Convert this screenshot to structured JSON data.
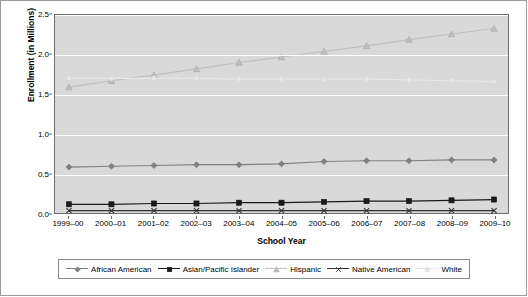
{
  "chart_data": {
    "type": "line",
    "title": "",
    "xlabel": "School Year",
    "ylabel": "Enrollment (in Millions)",
    "categories": [
      "1999–00",
      "2000–01",
      "2001–02",
      "2002–03",
      "2003–04",
      "2004–05",
      "2005–06",
      "2006–07",
      "2007–08",
      "2008–09",
      "2009–10"
    ],
    "ylim": [
      0.0,
      2.5
    ],
    "yticks": [
      0.0,
      0.5,
      1.0,
      1.5,
      2.0,
      2.5
    ],
    "ytick_labels": [
      "0.0",
      "0.5",
      "1.0",
      "1.5",
      "2.0",
      "2.5"
    ],
    "grid": "horizontal",
    "legend_position": "bottom",
    "series": [
      {
        "name": "African American",
        "color": "#808080",
        "marker": "diamond",
        "values": [
          0.58,
          0.59,
          0.6,
          0.61,
          0.61,
          0.62,
          0.65,
          0.66,
          0.66,
          0.67,
          0.67
        ]
      },
      {
        "name": "Asian/Pacific Islander",
        "color": "#1a1a1a",
        "marker": "square",
        "values": [
          0.11,
          0.11,
          0.12,
          0.12,
          0.13,
          0.13,
          0.14,
          0.15,
          0.15,
          0.16,
          0.17
        ]
      },
      {
        "name": "Hispanic",
        "color": "#bfbfbf",
        "marker": "triangle",
        "values": [
          1.59,
          1.67,
          1.74,
          1.82,
          1.9,
          1.97,
          2.04,
          2.11,
          2.19,
          2.26,
          2.33
        ]
      },
      {
        "name": "Native American",
        "color": "#333333",
        "marker": "x",
        "values": [
          0.03,
          0.03,
          0.03,
          0.03,
          0.03,
          0.03,
          0.03,
          0.03,
          0.03,
          0.03,
          0.03
        ]
      },
      {
        "name": "White",
        "color": "#e6e6e6",
        "marker": "circle",
        "values": [
          1.7,
          1.7,
          1.7,
          1.7,
          1.69,
          1.69,
          1.69,
          1.69,
          1.68,
          1.67,
          1.66
        ]
      }
    ]
  }
}
